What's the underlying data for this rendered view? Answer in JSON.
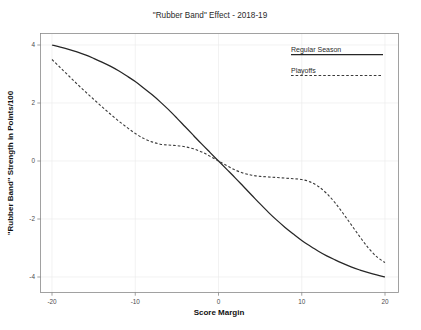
{
  "chart_data": {
    "type": "line",
    "title": "\"Rubber Band\" Effect - 2018-19",
    "xlabel": "Score Margin",
    "ylabel": "\"Rubber Band\" Strength in Points/100",
    "xlim": [
      -22,
      22
    ],
    "ylim": [
      -4.4,
      4.4
    ],
    "xticks": [
      -20,
      -10,
      0,
      10,
      20
    ],
    "xtick_labels": [
      "-20",
      "-10",
      "0",
      "10",
      "20"
    ],
    "yticks": [
      4,
      2,
      0,
      -2,
      -4
    ],
    "ytick_labels": [
      "4",
      "2",
      "0",
      "-2",
      "-4"
    ],
    "grid": true,
    "legend_position": "top-right",
    "series": [
      {
        "name": "Regular Season",
        "style": "solid",
        "color": "#262626",
        "x": [
          -20,
          -19,
          -18,
          -17,
          -16,
          -15,
          -14,
          -13,
          -12,
          -11,
          -10,
          -9,
          -8,
          -7,
          -6,
          -5,
          -4,
          -3,
          -2,
          -1,
          0,
          1,
          2,
          3,
          4,
          5,
          6,
          7,
          8,
          9,
          10,
          11,
          12,
          13,
          14,
          15,
          16,
          17,
          18,
          19,
          20
        ],
        "y": [
          4.0,
          3.93,
          3.85,
          3.76,
          3.66,
          3.54,
          3.41,
          3.27,
          3.11,
          2.93,
          2.74,
          2.52,
          2.29,
          2.04,
          1.77,
          1.48,
          1.18,
          0.88,
          0.58,
          0.29,
          0.0,
          -0.29,
          -0.58,
          -0.88,
          -1.18,
          -1.48,
          -1.77,
          -2.04,
          -2.29,
          -2.52,
          -2.74,
          -2.93,
          -3.11,
          -3.27,
          -3.41,
          -3.54,
          -3.66,
          -3.76,
          -3.85,
          -3.93,
          -4.0
        ]
      },
      {
        "name": "Playoffs",
        "style": "dashed",
        "color": "#3a3a3a",
        "x": [
          -20,
          -19,
          -18,
          -17,
          -16,
          -15,
          -14,
          -13,
          -12,
          -11,
          -10,
          -9,
          -8,
          -7,
          -6,
          -5,
          -4,
          -3,
          -2,
          -1,
          0,
          1,
          2,
          3,
          4,
          5,
          6,
          7,
          8,
          9,
          10,
          11,
          12,
          13,
          14,
          15,
          16,
          17,
          18,
          19,
          20
        ],
        "y": [
          3.5,
          3.22,
          2.94,
          2.66,
          2.39,
          2.13,
          1.87,
          1.62,
          1.38,
          1.16,
          0.95,
          0.78,
          0.66,
          0.58,
          0.55,
          0.53,
          0.49,
          0.42,
          0.31,
          0.16,
          0.0,
          -0.16,
          -0.31,
          -0.42,
          -0.49,
          -0.53,
          -0.55,
          -0.57,
          -0.59,
          -0.61,
          -0.64,
          -0.72,
          -0.88,
          -1.12,
          -1.44,
          -1.82,
          -2.22,
          -2.62,
          -3.0,
          -3.3,
          -3.5
        ]
      }
    ]
  }
}
